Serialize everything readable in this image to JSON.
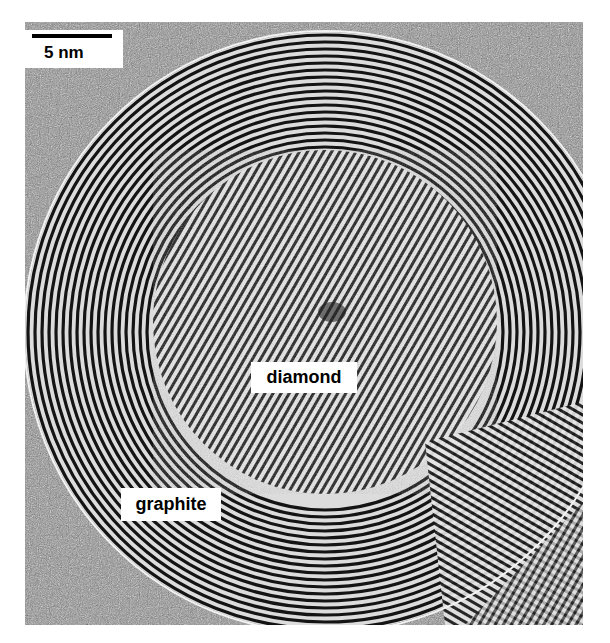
{
  "figure": {
    "type": "TEM micrograph",
    "colors": {
      "background": "#ffffff",
      "noise_gray": "#8a8a8a",
      "fringe_dark": "#111111",
      "fringe_light": "#eeeeee"
    }
  },
  "scale_bar": {
    "label": "5 nm"
  },
  "labels": {
    "core": "diamond",
    "shell": "graphite"
  }
}
